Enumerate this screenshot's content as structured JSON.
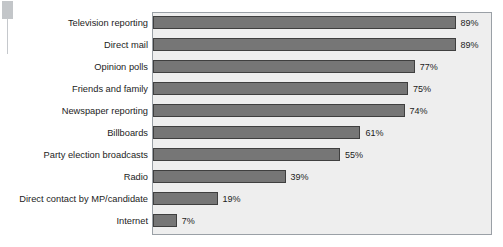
{
  "chart_data": {
    "type": "bar",
    "orientation": "horizontal",
    "title": "",
    "xlabel": "",
    "ylabel": "",
    "xlim": [
      0,
      100
    ],
    "grid": false,
    "legend": false,
    "value_suffix": "%",
    "categories": [
      "Television reporting",
      "Direct mail",
      "Opinion polls",
      "Friends and family",
      "Newspaper reporting",
      "Billboards",
      "Party election broadcasts",
      "Radio",
      "Direct contact by MP/candidate",
      "Internet"
    ],
    "values": [
      89,
      89,
      77,
      75,
      74,
      61,
      55,
      39,
      19,
      7
    ],
    "value_labels": [
      "89%",
      "89%",
      "77%",
      "75%",
      "74%",
      "61%",
      "55%",
      "39%",
      "19%",
      "7%"
    ]
  },
  "style": {
    "bar_fill": "#767676",
    "bar_stroke": "#3f3f3f",
    "plot_background": "#eeeeee",
    "plot_border": "#9aa0a6",
    "page_background": "#ffffff",
    "text_color": "#1c1c1c"
  }
}
